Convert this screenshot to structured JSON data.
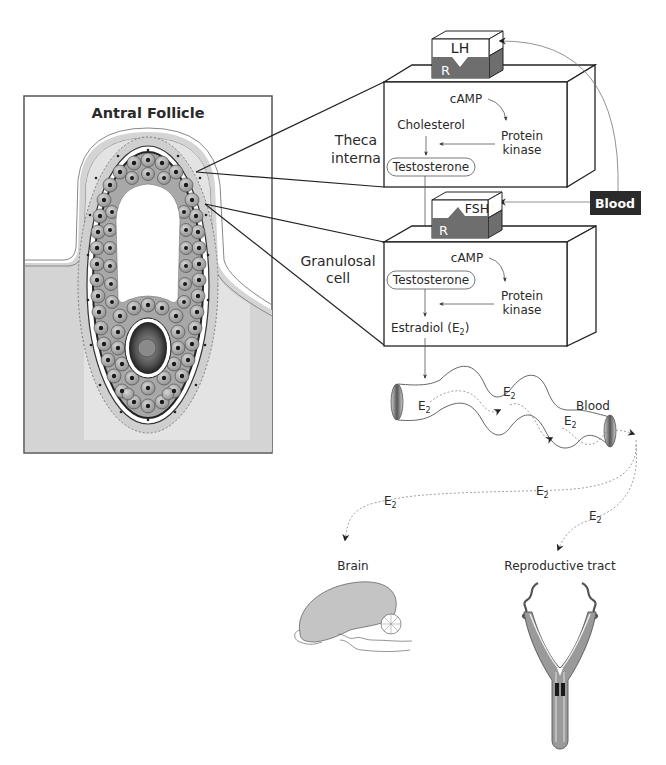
{
  "follicle_panel": {
    "title": "Antral Follicle"
  },
  "theca": {
    "label_line1": "Theca",
    "label_line2": "interna",
    "receptor_hormone": "LH",
    "receptor_label": "R",
    "camp": "cAMP",
    "cholesterol": "Cholesterol",
    "protein_line1": "Protein",
    "protein_line2": "kinase",
    "testosterone": "Testosterone"
  },
  "granulosa": {
    "label_line1": "Granulosal",
    "label_line2": "cell",
    "receptor_hormone": "FSH",
    "receptor_label": "R",
    "camp": "cAMP",
    "testosterone": "Testosterone",
    "protein_line1": "Protein",
    "protein_line2": "kinase",
    "estradiol": "Estradiol (E",
    "estradiol_sub": "2",
    "estradiol_close": ")"
  },
  "blood_source": {
    "label": "Blood"
  },
  "vessel": {
    "label": "Blood",
    "e2_labels": [
      {
        "text": "E",
        "sub": "2"
      },
      {
        "text": "E",
        "sub": "2"
      },
      {
        "text": "E",
        "sub": "2"
      },
      {
        "text": "E",
        "sub": "2"
      },
      {
        "text": "E",
        "sub": "2"
      },
      {
        "text": "E",
        "sub": "2"
      }
    ]
  },
  "targets": {
    "brain": "Brain",
    "reproductive": "Reproductive  tract"
  },
  "colors": {
    "receptor_dark": "#6e6e6e",
    "panel_gray": "#d4d4d4",
    "blood_box": "#2b2b2b",
    "cell_gray": "#a8a8a8"
  }
}
